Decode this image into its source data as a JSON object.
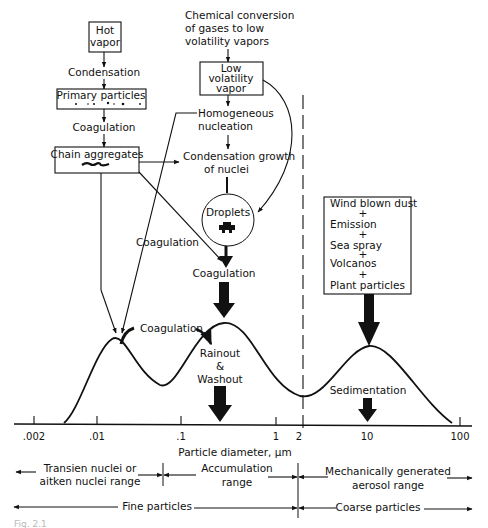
{
  "top_text": {
    "chemical_conversion": [
      "Chemical conversion",
      "of gases to low",
      "volatility vapors"
    ]
  },
  "boxes": {
    "hot_vapor": [
      "Hot",
      "vapor"
    ],
    "primary_particles": "Primary particles",
    "chain_aggregates": "Chain aggregates",
    "low_volatility_vapor": [
      "Low",
      "volatility",
      "vapor"
    ],
    "mechanical_sources": [
      "Wind blown dust",
      "+",
      "Emission",
      "+",
      "Sea spray",
      "+",
      "Volcanos",
      "+",
      "Plant particles"
    ]
  },
  "labels": {
    "condensation": "Condensation",
    "coagulation_1": "Coagulation",
    "homogeneous_nucleation": [
      "Homogeneous",
      "nucleation"
    ],
    "condensation_growth": [
      "Condensation growth",
      "of nuclei"
    ],
    "droplets": "Droplets",
    "coagulation_left": "Coagulation",
    "coagulation_mid": "Coagulation",
    "coagulation_peak": "Coagulation",
    "rainout": [
      "Rainout",
      "&",
      "Washout"
    ],
    "sedimentation": "Sedimentation"
  },
  "axis": {
    "title": "Particle diameter, μm",
    "ticks": [
      ".002",
      ".01",
      ".1",
      "1",
      "2",
      "10",
      "100"
    ]
  },
  "ranges": {
    "transient": [
      "Transien nuclei or",
      "aitken nuclei range"
    ],
    "accumulation": [
      "Accumulation",
      "range"
    ],
    "mechanical": [
      "Mechanically generated",
      "aerosol range"
    ],
    "fine": "Fine particles",
    "coarse": "Coarse particles"
  },
  "caption_fragment": "Fig. 2.1"
}
